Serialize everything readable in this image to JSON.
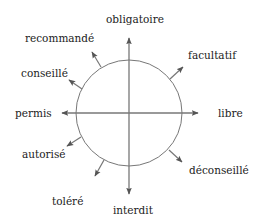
{
  "diagram": {
    "type": "radial-arrow-diagram",
    "center_shape": "circle with crosshair axes",
    "colors": {
      "line": "#777777",
      "arrow": "#555555",
      "text": "#222222",
      "background": "#ffffff"
    },
    "labels": {
      "top": "obligatoire",
      "top_right": "facultatif",
      "right": "libre",
      "bottom_right": "déconseillé",
      "bottom": "interdit",
      "bottom_left_low": "toléré",
      "bottom_left": "autorisé",
      "left": "permis",
      "top_left": "conseillé",
      "top_left_high": "recommandé"
    }
  }
}
